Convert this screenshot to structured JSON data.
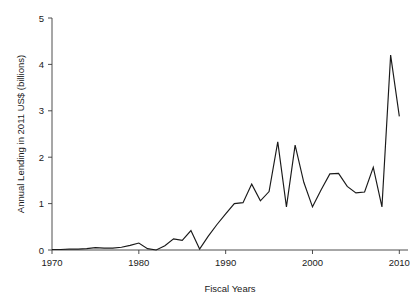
{
  "chart_data": {
    "type": "line",
    "title": "",
    "xlabel": "Fiscal Years",
    "ylabel": "Annual Lending in 2011 US$ (billions)",
    "xlim": [
      1970,
      2011
    ],
    "ylim": [
      0,
      5
    ],
    "xticks": [
      1970,
      1980,
      1990,
      2000,
      2010
    ],
    "xtick_labels": [
      "1970",
      "1980",
      "1990",
      "2000",
      "2010"
    ],
    "yticks": [
      0,
      1,
      2,
      3,
      4,
      5
    ],
    "ytick_labels": [
      "0",
      "1",
      "2",
      "3",
      "4",
      "5"
    ],
    "grid": false,
    "legend": false,
    "line_color": "#1a1a1a",
    "x": [
      1970,
      1971,
      1972,
      1973,
      1974,
      1975,
      1976,
      1977,
      1978,
      1979,
      1980,
      1981,
      1982,
      1983,
      1984,
      1985,
      1986,
      1987,
      1988,
      1989,
      1990,
      1991,
      1992,
      1993,
      1994,
      1995,
      1996,
      1997,
      1998,
      1999,
      2000,
      2001,
      2002,
      2003,
      2004,
      2005,
      2006,
      2007,
      2008,
      2009,
      2010
    ],
    "values": [
      0.01,
      0.01,
      0.02,
      0.02,
      0.03,
      0.05,
      0.04,
      0.04,
      0.06,
      0.1,
      0.15,
      0.03,
      0.0,
      0.09,
      0.24,
      0.21,
      0.42,
      0.02,
      0.3,
      0.55,
      0.78,
      1.0,
      1.02,
      1.42,
      1.06,
      1.26,
      2.33,
      0.93,
      2.26,
      1.46,
      0.93,
      1.3,
      1.64,
      1.65,
      1.37,
      1.23,
      1.25,
      1.78,
      0.93,
      4.2,
      2.88
    ],
    "series_name": "Annual Lending"
  },
  "axis_titles": {
    "x": "Fiscal Years",
    "y": "Annual Lending in 2011 US$ (billions)"
  }
}
